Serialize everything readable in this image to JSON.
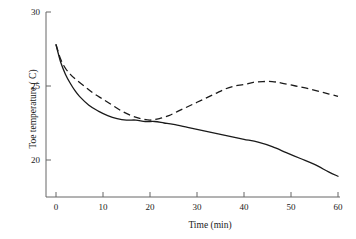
{
  "chart_data": {
    "type": "line",
    "title": "",
    "xlabel": "Time (min)",
    "ylabel": "Toe temperature ( C)",
    "xlim": [
      0,
      60
    ],
    "ylim": [
      18,
      30
    ],
    "grid": false,
    "legend": "none",
    "x_ticks": [
      0,
      10,
      20,
      30,
      40,
      50,
      60
    ],
    "x_tick_labels": [
      "0",
      "10",
      "20",
      "30",
      "40",
      "50",
      "60"
    ],
    "y_ticks": [
      20,
      25,
      30
    ],
    "y_tick_labels": [
      "20",
      "25",
      "30"
    ],
    "series": [
      {
        "name": "solid-curve",
        "style": "solid",
        "color": "#1a1a1a",
        "x": [
          0,
          1,
          2,
          3,
          4,
          5,
          7,
          9,
          11,
          13,
          15,
          17,
          19,
          21,
          23,
          25,
          28,
          31,
          34,
          37,
          40,
          43,
          46,
          49,
          52,
          55,
          58,
          60
        ],
        "y": [
          27.8,
          26.6,
          25.8,
          25.2,
          24.7,
          24.3,
          23.7,
          23.3,
          23.0,
          22.8,
          22.7,
          22.7,
          22.6,
          22.6,
          22.5,
          22.4,
          22.2,
          22.0,
          21.8,
          21.6,
          21.4,
          21.2,
          20.9,
          20.5,
          20.1,
          19.7,
          19.2,
          18.9
        ]
      },
      {
        "name": "dashed-curve",
        "style": "dashed",
        "color": "#1a1a1a",
        "x": [
          0,
          1,
          2,
          3,
          4,
          6,
          8,
          10,
          12,
          14,
          16,
          18,
          20,
          22,
          24,
          26,
          28,
          30,
          32,
          34,
          36,
          38,
          40,
          42,
          44,
          46,
          48,
          51,
          54,
          57,
          60
        ],
        "y": [
          27.8,
          26.8,
          26.2,
          25.8,
          25.5,
          25.0,
          24.5,
          24.1,
          23.7,
          23.3,
          23.0,
          22.8,
          22.7,
          22.8,
          23.0,
          23.3,
          23.6,
          23.9,
          24.2,
          24.5,
          24.8,
          25.0,
          25.1,
          25.25,
          25.3,
          25.3,
          25.2,
          25.0,
          24.8,
          24.55,
          24.3
        ]
      }
    ]
  },
  "axis": {
    "x_axis_name": "x-axis-line",
    "y_axis_name": "y-axis-line"
  }
}
